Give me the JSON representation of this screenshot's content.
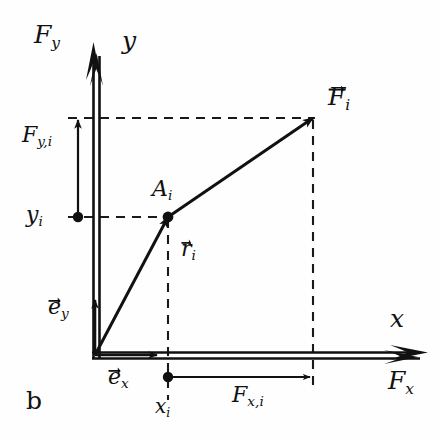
{
  "figure": {
    "caption": "b",
    "background_color": "#fefefe",
    "ink_color": "#111111",
    "axes": {
      "origin": [
        95,
        355
      ],
      "y_axis": {
        "name": "y",
        "label": "y",
        "force_label": "F",
        "force_label_sub": "y",
        "style": "double-line-with-double-arrowhead",
        "from": [
          97,
          355
        ],
        "to": [
          97,
          42
        ]
      },
      "x_axis": {
        "name": "x",
        "label": "x",
        "force_label": "F",
        "force_label_sub": "x",
        "style": "double-line-with-double-arrowhead",
        "from": [
          95,
          355
        ],
        "to": [
          426,
          355
        ]
      }
    },
    "point": {
      "name": "A",
      "label": "A",
      "label_sub": "i",
      "position": [
        168,
        217
      ]
    },
    "coordinates": {
      "y_value_label": "y",
      "y_value_sub": "i",
      "y_value_pos": [
        78,
        217
      ],
      "x_value_label": "x",
      "x_value_sub": "i",
      "x_value_pos": [
        168,
        377
      ]
    },
    "vectors": [
      {
        "name": "position-vector",
        "label": "r",
        "label_sub": "i",
        "overarrow": true,
        "from": [
          95,
          355
        ],
        "to": [
          168,
          217
        ],
        "label_pos": [
          182,
          240
        ]
      },
      {
        "name": "force-vector",
        "label": "F",
        "label_sub": "i",
        "overarrow": true,
        "from": [
          168,
          217
        ],
        "to": [
          313,
          118
        ],
        "label_pos": [
          330,
          90
        ]
      },
      {
        "name": "unit-vector-ey",
        "label": "e",
        "label_sub": "y",
        "overarrow": true,
        "from": [
          95,
          355
        ],
        "to": [
          95,
          300
        ],
        "label_pos": [
          56,
          300
        ]
      },
      {
        "name": "unit-vector-ex",
        "label": "e",
        "label_sub": "x",
        "overarrow": true,
        "from": [
          95,
          355
        ],
        "to": [
          155,
          355
        ],
        "label_pos": [
          113,
          372
        ]
      },
      {
        "name": "force-component-y",
        "label": "F",
        "label_sub": "y,i",
        "overarrow": false,
        "from": [
          78,
          217
        ],
        "to": [
          78,
          120
        ],
        "label_pos": [
          28,
          130
        ]
      },
      {
        "name": "force-component-x",
        "label": "F",
        "label_sub": "x,i",
        "overarrow": false,
        "from": [
          168,
          377
        ],
        "to": [
          313,
          377
        ],
        "label_pos": [
          238,
          390
        ]
      }
    ],
    "dashed_guides": [
      {
        "name": "fy-level-line",
        "from": [
          68,
          118
        ],
        "to": [
          315,
          118
        ]
      },
      {
        "name": "yi-level-line",
        "from": [
          68,
          217
        ],
        "to": [
          168,
          217
        ]
      },
      {
        "name": "ai-drop-line",
        "from": [
          168,
          217
        ],
        "to": [
          168,
          400
        ]
      },
      {
        "name": "force-tip-drop-line",
        "from": [
          313,
          118
        ],
        "to": [
          313,
          388
        ]
      }
    ]
  }
}
